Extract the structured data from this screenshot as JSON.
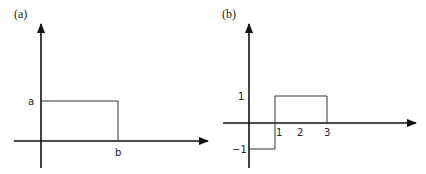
{
  "panels": [
    {
      "label": "(a)",
      "y_tick": "a",
      "x_tick": "b",
      "description": "rectangular pulse of height a from 0 to b"
    },
    {
      "label": "(b)",
      "y_ticks": [
        "1",
        "−1"
      ],
      "x_ticks": [
        "1",
        "2",
        "3"
      ],
      "description": "value −1 on (0,1), value 1 on (1,3)"
    }
  ],
  "colors": {
    "axis": "#111111",
    "curve": "#333333",
    "text": "#222222"
  }
}
